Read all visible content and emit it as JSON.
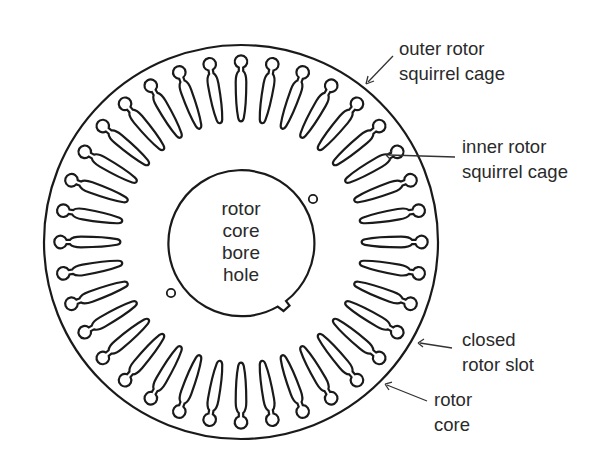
{
  "diagram": {
    "slot_count": 36,
    "center_text": [
      "rotor",
      "core",
      "bore",
      "hole"
    ],
    "labels": {
      "outer_cage": [
        "outer rotor",
        "squirrel cage"
      ],
      "inner_cage": [
        "inner rotor",
        "squirrel cage"
      ],
      "closed_slot": [
        "closed",
        "rotor slot"
      ],
      "rotor_core": [
        "rotor",
        "core"
      ]
    },
    "colors": {
      "line": "#1a1a1a",
      "text": "#2a2a2a",
      "background": "#ffffff"
    }
  }
}
